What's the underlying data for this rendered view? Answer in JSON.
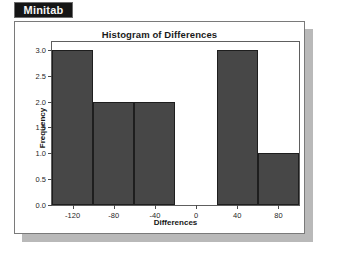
{
  "badge": {
    "label": "Minitab",
    "background": "#151515",
    "text_color": "#f4f4f4"
  },
  "window": {
    "background": "#ffffff",
    "border_color": "#7a7a7a",
    "shadow_color": "#b9b9b9"
  },
  "chart_data": {
    "type": "bar",
    "title": "Histogram of Differences",
    "xlabel": "Differences",
    "ylabel": "Frequency",
    "bar_color": "#474747",
    "bar_edge_color": "#1e1e1e",
    "grid": false,
    "legend": "none",
    "xlim": [
      -140,
      100
    ],
    "ylim": [
      0,
      3.15
    ],
    "bin_width": 40,
    "bin_edges": [
      -140,
      -100,
      -60,
      -20,
      20,
      60,
      100
    ],
    "categories": [
      "-140 to -100",
      "-100 to -60",
      "-60 to -20",
      "-20 to 20",
      "20 to 60",
      "60 to 100"
    ],
    "values": [
      3,
      2,
      2,
      0,
      3,
      1
    ],
    "xticks": [
      -120,
      -80,
      -40,
      0,
      40,
      80
    ],
    "xticklabels": [
      "-120",
      "-80",
      "-40",
      "0",
      "40",
      "80"
    ],
    "yticks": [
      0.0,
      0.5,
      1.0,
      1.5,
      2.0,
      2.5,
      3.0
    ],
    "yticklabels": [
      "0.0",
      "0.5",
      "1.0",
      "1.5",
      "2.0",
      "2.5",
      "3.0"
    ]
  }
}
